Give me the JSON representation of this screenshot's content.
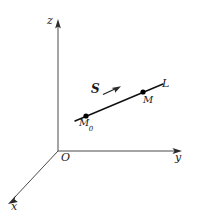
{
  "figure": {
    "type": "math-diagram",
    "background_color": "#ffffff",
    "stroke_color": "#1a1a1a",
    "axis_color": "#4a4a4a"
  },
  "axes": {
    "z": {
      "label": "z",
      "origin": [
        58,
        151
      ],
      "tip": [
        58,
        22
      ]
    },
    "y": {
      "label": "y",
      "origin": [
        58,
        151
      ],
      "tip": [
        181,
        151
      ]
    },
    "x": {
      "label": "x",
      "origin": [
        58,
        151
      ],
      "tip": [
        9,
        203
      ]
    },
    "origin": {
      "label": "O",
      "position": [
        58,
        151
      ]
    }
  },
  "line": {
    "label": "L",
    "start": [
      75,
      121
    ],
    "end": [
      163,
      84
    ]
  },
  "points": [
    {
      "label": "M",
      "sub": "0",
      "full_label": "M0",
      "position": [
        86,
        116
      ]
    },
    {
      "label": "M",
      "sub": "",
      "full_label": "M",
      "position": [
        143,
        92
      ]
    }
  ],
  "vector": {
    "label": "S",
    "tail": [
      104,
      94
    ],
    "head": [
      120,
      87
    ]
  }
}
